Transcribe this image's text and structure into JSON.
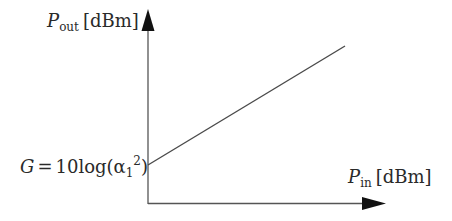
{
  "diagram": {
    "type": "linear gain characteristic (log-log)",
    "colors": {
      "axis": "#555555",
      "line": "#4a4a4a",
      "arrow": "#111111",
      "text": "#2a2a2a"
    },
    "y_axis": {
      "symbol": "P",
      "subscript": "out",
      "unit": "[dBm]"
    },
    "x_axis": {
      "symbol": "P",
      "subscript": "in",
      "unit": "[dBm]"
    },
    "intercept_label": {
      "lhs": "G",
      "eq": "=",
      "rhs_prefix": "10log(",
      "alpha": "α",
      "alpha_sub": "1",
      "alpha_sup": "2",
      "rhs_suffix": ")"
    }
  }
}
